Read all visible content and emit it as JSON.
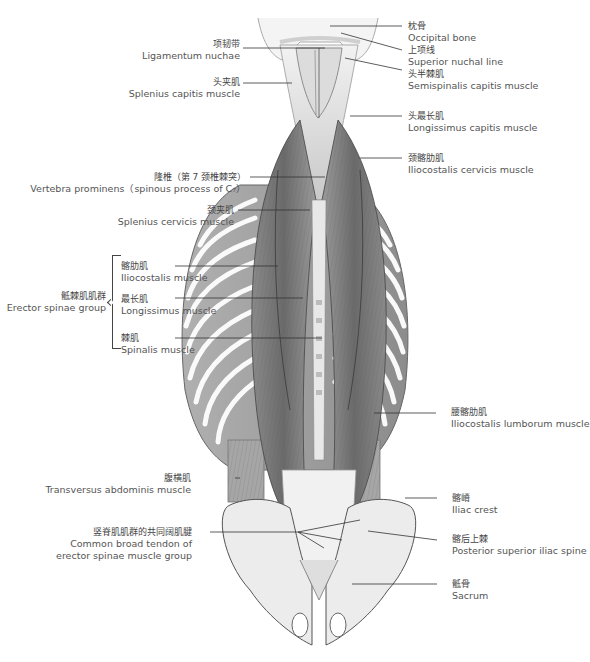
{
  "figure": {
    "colors": {
      "muscle_dark": "#6e6e6e",
      "muscle_mid": "#9a9a9a",
      "muscle_light": "#c8c8c8",
      "bone": "#ececec",
      "bone_outline": "#555555",
      "leader_line": "#333333",
      "text": "#444444"
    }
  },
  "labels_left": [
    {
      "zh": "项韧带",
      "en": "Ligamentum nuchae"
    },
    {
      "zh": "头夹肌",
      "en": "Splenius capitis muscle"
    },
    {
      "zh": "隆椎（第 7 颈椎棘突）",
      "en": "Vertebra prominens（spinous process of C₇）"
    },
    {
      "zh": "颈夹肌",
      "en": "Splenius cervicis muscle"
    },
    {
      "zh": "腹横肌",
      "en": "Transversus abdominis muscle"
    },
    {
      "zh": "竖脊肌肌群的共同阔肌腱",
      "en": "Common broad tendon  of",
      "en2": "erector spinae muscle group"
    }
  ],
  "group": {
    "zh": "骶棘肌肌群",
    "en": "Erector spinae group",
    "members": [
      {
        "zh": "髂肋肌",
        "en": "Iliocostalis muscle"
      },
      {
        "zh": "最长肌",
        "en": "Longissimus muscle"
      },
      {
        "zh": "棘肌",
        "en": "Spinalis muscle"
      }
    ]
  },
  "labels_right": [
    {
      "zh": "枕骨",
      "en": "Occipital bone"
    },
    {
      "zh": "上项线",
      "en": "Superior nuchal line"
    },
    {
      "zh": "头半棘肌",
      "en": "Semispinalis capitis muscle"
    },
    {
      "zh": "头最长肌",
      "en": "Longissimus capitis muscle"
    },
    {
      "zh": "颈髂肋肌",
      "en": "Iliocostalis cervicis muscle"
    },
    {
      "zh": "腰髂肋肌",
      "en": "Iliocostalis lumborum muscle"
    },
    {
      "zh": "髂嵴",
      "en": "Iliac crest"
    },
    {
      "zh": "髂后上棘",
      "en": "Posterior superior iliac spine"
    },
    {
      "zh": "骶骨",
      "en": "Sacrum"
    }
  ]
}
